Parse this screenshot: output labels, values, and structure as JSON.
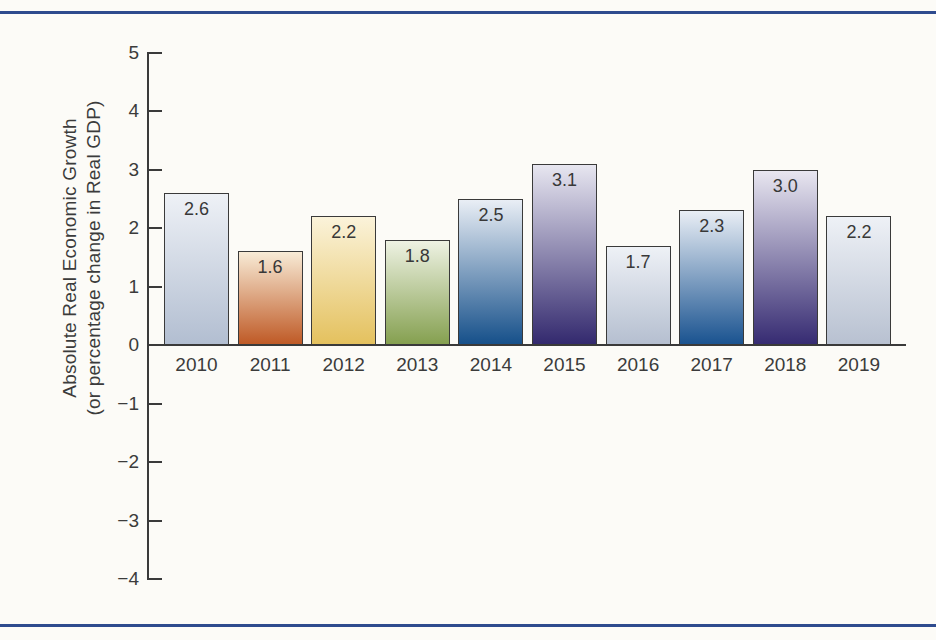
{
  "page": {
    "background": "#fcfbf7",
    "rule_color": "#2e4b8e"
  },
  "chart_data": {
    "type": "bar",
    "title": "",
    "xlabel": "",
    "ylabel_line1": "Absolute Real Economic Growth",
    "ylabel_line2": "(or percentage change in Real GDP)",
    "categories": [
      "2010",
      "2011",
      "2012",
      "2013",
      "2014",
      "2015",
      "2016",
      "2017",
      "2018",
      "2019"
    ],
    "values": [
      2.6,
      1.6,
      2.2,
      1.8,
      2.5,
      3.1,
      1.7,
      2.3,
      3.0,
      2.2
    ],
    "value_labels": [
      "2.6",
      "1.6",
      "2.2",
      "1.8",
      "2.5",
      "3.1",
      "1.7",
      "2.3",
      "3.0",
      "2.2"
    ],
    "ylim": [
      -4,
      5
    ],
    "yticks": [
      5,
      4,
      3,
      2,
      1,
      0,
      -1,
      -2,
      -3,
      -4
    ],
    "ytick_labels": [
      "5",
      "4",
      "3",
      "2",
      "1",
      "0",
      "−1",
      "−2",
      "−3",
      "−4"
    ],
    "grid": false,
    "legend": null,
    "axis_color": "#3a3a3a",
    "text_color": "#3b3b3b",
    "bar_colors": [
      {
        "top": "#eef1f6",
        "bottom": "#b2bed1"
      },
      {
        "top": "#f8ebd6",
        "bottom": "#bf5a26"
      },
      {
        "top": "#fbf3da",
        "bottom": "#e4c15e"
      },
      {
        "top": "#eef2e3",
        "bottom": "#85a050"
      },
      {
        "top": "#e9eef5",
        "bottom": "#16508a"
      },
      {
        "top": "#e7e6f0",
        "bottom": "#33296e"
      },
      {
        "top": "#eef1f6",
        "bottom": "#b5bfd0"
      },
      {
        "top": "#e9eef5",
        "bottom": "#1a5390"
      },
      {
        "top": "#e8e6f0",
        "bottom": "#362b72"
      },
      {
        "top": "#eef1f6",
        "bottom": "#b8c1d1"
      }
    ]
  }
}
